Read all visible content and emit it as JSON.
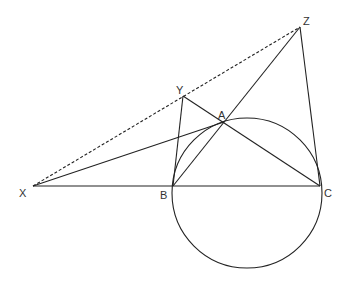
{
  "diagram": {
    "type": "geometry",
    "points": {
      "X": {
        "label": "X",
        "x": 33,
        "y": 186
      },
      "B": {
        "label": "B",
        "x": 173,
        "y": 186
      },
      "C": {
        "label": "C",
        "x": 320,
        "y": 186
      },
      "A": {
        "label": "A",
        "x": 224,
        "y": 122
      },
      "Y": {
        "label": "Y",
        "x": 183,
        "y": 96
      },
      "Z": {
        "label": "Z",
        "x": 300,
        "y": 27
      }
    },
    "circle": {
      "cx": 247,
      "cy": 193,
      "r": 75
    },
    "segments": [
      [
        "X",
        "C"
      ],
      [
        "X",
        "A"
      ],
      [
        "Y",
        "B"
      ],
      [
        "Y",
        "C"
      ],
      [
        "B",
        "Z"
      ],
      [
        "Z",
        "C"
      ],
      [
        "B",
        "A"
      ]
    ],
    "dashed_segments": [
      [
        "X",
        "Z"
      ]
    ],
    "stroke_color": "#222222"
  }
}
